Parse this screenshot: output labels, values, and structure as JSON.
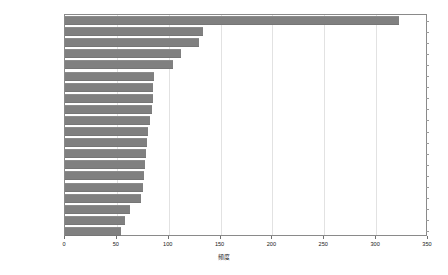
{
  "chart_data": {
    "type": "bar",
    "orientation": "horizontal",
    "title": "",
    "xlabel": "頻度",
    "ylabel": "",
    "xlim": [
      0,
      350
    ],
    "xticks": [
      0,
      50,
      100,
      150,
      200,
      250,
      300,
      350
    ],
    "grid": true,
    "legend": false,
    "bar_color": "#808080",
    "categories": [
      "行う",
      "非常",
      "ミャンマー",
      "発展",
      "思う",
      "良い",
      "国家",
      "話し合い",
      "建設",
      "必要",
      "政府",
      "国軍",
      "地域",
      "国民",
      "国",
      "任務",
      "言う",
      "入る",
      "行く",
      "受ける"
    ],
    "values": [
      322,
      133,
      129,
      112,
      104,
      86,
      85,
      85,
      84,
      82,
      80,
      79,
      78,
      77,
      76,
      75,
      73,
      63,
      58,
      54
    ]
  },
  "axis": {
    "tick_labels": [
      "0",
      "50",
      "100",
      "150",
      "200",
      "250",
      "300",
      "350"
    ],
    "title": "頻度"
  }
}
